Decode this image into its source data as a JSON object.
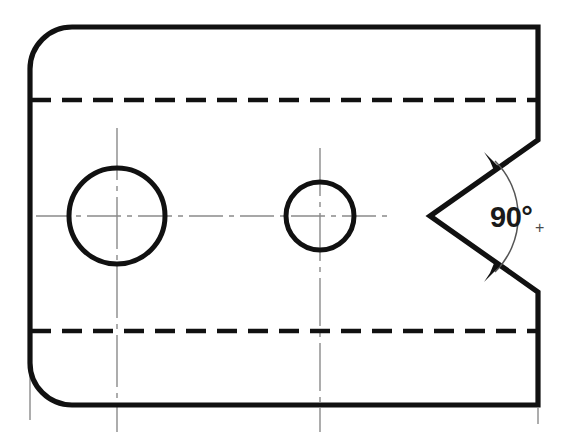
{
  "drawing": {
    "title": "Machined plate orthographic view with V-notch",
    "background_color": "#ffffff",
    "line_color": "#111111",
    "centerline_color": "#8a8a8a",
    "hidden_line_color": "#111111",
    "canvas": {
      "width": 562,
      "height": 439
    }
  },
  "annotations": {
    "angle_value": "90°",
    "angle_tolerance_symbol": "+",
    "angle_label_full": "90°+"
  },
  "features": [
    {
      "name": "large-through-hole",
      "type": "circle",
      "cx": 117,
      "cy": 216,
      "r": 48
    },
    {
      "name": "small-through-hole",
      "type": "circle",
      "cx": 320,
      "cy": 216,
      "r": 34
    },
    {
      "name": "v-notch",
      "type": "vee",
      "apex_x": 430,
      "apex_y": 216,
      "included_angle": "90°"
    },
    {
      "name": "upper-hidden-line",
      "type": "dashed-line",
      "y": 100
    },
    {
      "name": "lower-hidden-line",
      "type": "dashed-line",
      "y": 331
    },
    {
      "name": "horizontal-centerline",
      "type": "centerline",
      "y": 216
    },
    {
      "name": "left-rounded-corner",
      "type": "fillet",
      "radius": 42
    },
    {
      "name": "bottom-left-rounded-corner",
      "type": "fillet",
      "radius": 42
    }
  ]
}
